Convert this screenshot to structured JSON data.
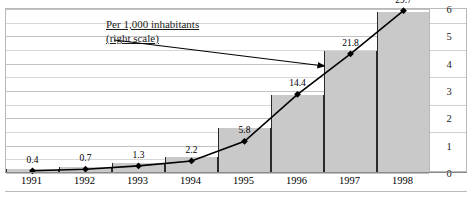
{
  "chart_data": {
    "type": "bar",
    "title": "",
    "subtitle": "",
    "xlabel": "",
    "ylabel": "",
    "categories": [
      "1991",
      "1992",
      "1993",
      "1994",
      "1995",
      "1996",
      "1997",
      "1998"
    ],
    "series": [
      {
        "name": "Per 1,000 inhabitants (right scale)",
        "type": "line",
        "marker": "diamond",
        "axis": "right",
        "values": [
          0.08,
          0.14,
          0.26,
          0.44,
          1.16,
          2.88,
          4.36,
          5.94
        ],
        "data_labels": [
          "0.4",
          "0.7",
          "1.3",
          "2.2",
          "5.8",
          "14.4",
          "21.8",
          "29.7"
        ],
        "raw_values": [
          0.4,
          0.7,
          1.3,
          2.2,
          5.8,
          14.4,
          21.8,
          29.7
        ],
        "color": "#000000"
      },
      {
        "name": "bars",
        "type": "bar",
        "axis": "right",
        "values": [
          0.12,
          0.2,
          0.33,
          0.55,
          1.62,
          2.82,
          4.42,
          5.85
        ],
        "color": "#c9c9c9"
      }
    ],
    "ylim": [
      0,
      6
    ],
    "yticks": [
      0,
      1,
      2,
      3,
      4,
      5,
      6
    ],
    "ytick_labels": [
      "0",
      "1",
      "2",
      "3",
      "4",
      "5",
      "6"
    ],
    "minor_gridlines": true,
    "minor_gridline_step": 0.5,
    "grid": true,
    "legend": "none",
    "annotations": [
      {
        "id": "right-scale-note",
        "line1": "Per 1,000 inhabitants",
        "line2": "(right scale)",
        "underline": true,
        "arrow_to_category": "1997"
      }
    ]
  },
  "axis": {
    "right_ticks": [
      "6",
      "5",
      "4",
      "3",
      "2",
      "1",
      "0"
    ]
  },
  "xaxis": {
    "labels": [
      "1991",
      "1992",
      "1993",
      "1994",
      "1995",
      "1996",
      "1997",
      "1998"
    ]
  },
  "labels": {
    "points": [
      "0.4",
      "0.7",
      "1.3",
      "2.2",
      "5.8",
      "14.4",
      "21.8",
      "29.7"
    ]
  },
  "annotation": {
    "line1": "Per 1,000 inhabitants",
    "line2": "(right scale)"
  },
  "colors": {
    "bar_fill": "#c9c9c9",
    "bar_edge": "#2a2a2a",
    "line": "#000000",
    "grid": "#d7d7d7",
    "frame": "#b9b9b9",
    "text": "#000000"
  }
}
